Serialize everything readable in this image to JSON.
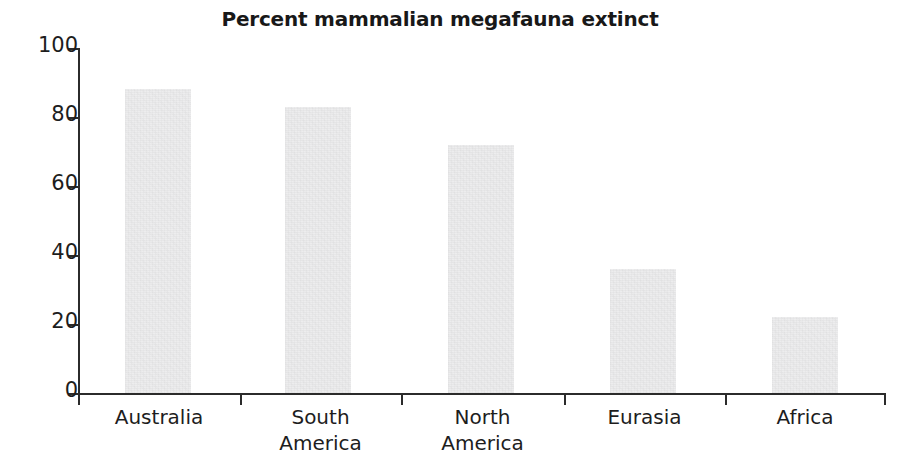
{
  "chart_data": {
    "type": "bar",
    "title": "Percent mammalian megafauna extinct",
    "xlabel": "",
    "ylabel": "",
    "categories": [
      "Australia",
      "South America",
      "North America",
      "Eurasia",
      "Africa"
    ],
    "category_lines": [
      [
        "Australia"
      ],
      [
        "South",
        "America"
      ],
      [
        "North",
        "America"
      ],
      [
        "Eurasia"
      ],
      [
        "Africa"
      ]
    ],
    "values": [
      88,
      83,
      72,
      36,
      22
    ],
    "ylim": [
      0,
      100
    ],
    "yticks": [
      0,
      20,
      40,
      60,
      80,
      100
    ],
    "ytick_labels": [
      "0",
      "20",
      "40",
      "60",
      "80",
      "100"
    ],
    "grid": false,
    "legend": false,
    "bar_color": "#ededee",
    "axis_color": "#2b2b2b",
    "title_color": "#181818",
    "background": "#ffffff"
  }
}
